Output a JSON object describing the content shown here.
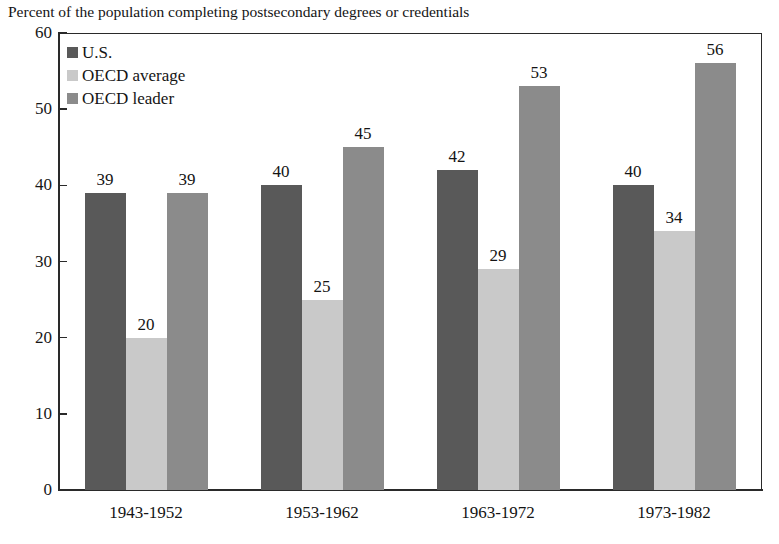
{
  "chart_data": {
    "type": "bar",
    "title": "Percent of the population completing postsecondary degrees or credentials",
    "xlabel": "",
    "ylabel": "",
    "ylim": [
      0,
      60
    ],
    "yticks": [
      0,
      10,
      20,
      30,
      40,
      50,
      60
    ],
    "grid": false,
    "legend_position": "top-left",
    "categories": [
      "1943-1952",
      "1953-1962",
      "1963-1972",
      "1973-1982"
    ],
    "series": [
      {
        "name": "U.S.",
        "color": "#595959",
        "values": [
          39,
          40,
          42,
          40
        ]
      },
      {
        "name": "OECD average",
        "color": "#c9c9c9",
        "values": [
          20,
          25,
          29,
          34
        ]
      },
      {
        "name": "OECD leader",
        "color": "#8b8b8b",
        "values": [
          39,
          45,
          53,
          56
        ]
      }
    ],
    "data_labels": [
      [
        "39",
        "20",
        "39"
      ],
      [
        "40",
        "25",
        "45"
      ],
      [
        "42",
        "29",
        "53"
      ],
      [
        "40",
        "34",
        "56"
      ]
    ],
    "ytick_labels": [
      "60",
      "50",
      "40",
      "30",
      "20",
      "10",
      "0"
    ]
  },
  "legend": {
    "items": [
      {
        "label": "U.S."
      },
      {
        "label": "OECD average"
      },
      {
        "label": "OECD leader"
      }
    ]
  }
}
